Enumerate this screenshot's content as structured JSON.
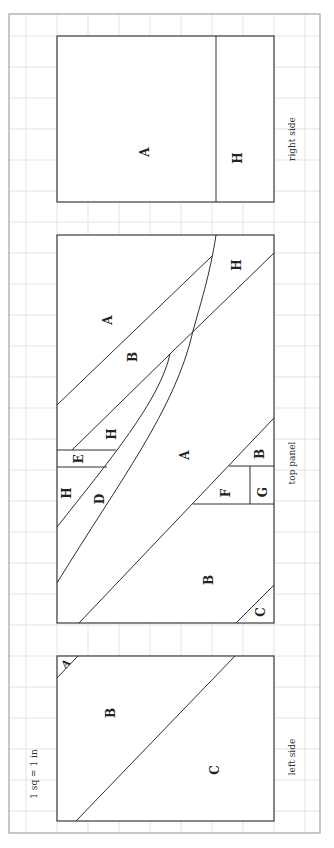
{
  "diagram": {
    "scale_note": "1 sq = 1 in",
    "orientation": "rotated 90deg counter-clockwise",
    "colors": {
      "grid": "#e3e3e3",
      "outline": "#3a3a3a",
      "border": "#a9a9a9",
      "text": "#222222"
    },
    "panels": [
      {
        "name": "right side",
        "caption": "right side",
        "pieces": [
          {
            "label": "A"
          },
          {
            "label": "H"
          }
        ]
      },
      {
        "name": "top panel",
        "caption": "top panel",
        "pieces": [
          {
            "label": "A"
          },
          {
            "label": "B"
          },
          {
            "label": "H"
          },
          {
            "label": "H"
          },
          {
            "label": "E"
          },
          {
            "label": "H"
          },
          {
            "label": "D"
          },
          {
            "label": "A"
          },
          {
            "label": "B"
          },
          {
            "label": "F"
          },
          {
            "label": "G"
          },
          {
            "label": "B"
          },
          {
            "label": "C"
          }
        ]
      },
      {
        "name": "left side",
        "caption": "left side",
        "pieces": [
          {
            "label": "A"
          },
          {
            "label": "B"
          },
          {
            "label": "C"
          }
        ]
      }
    ]
  }
}
